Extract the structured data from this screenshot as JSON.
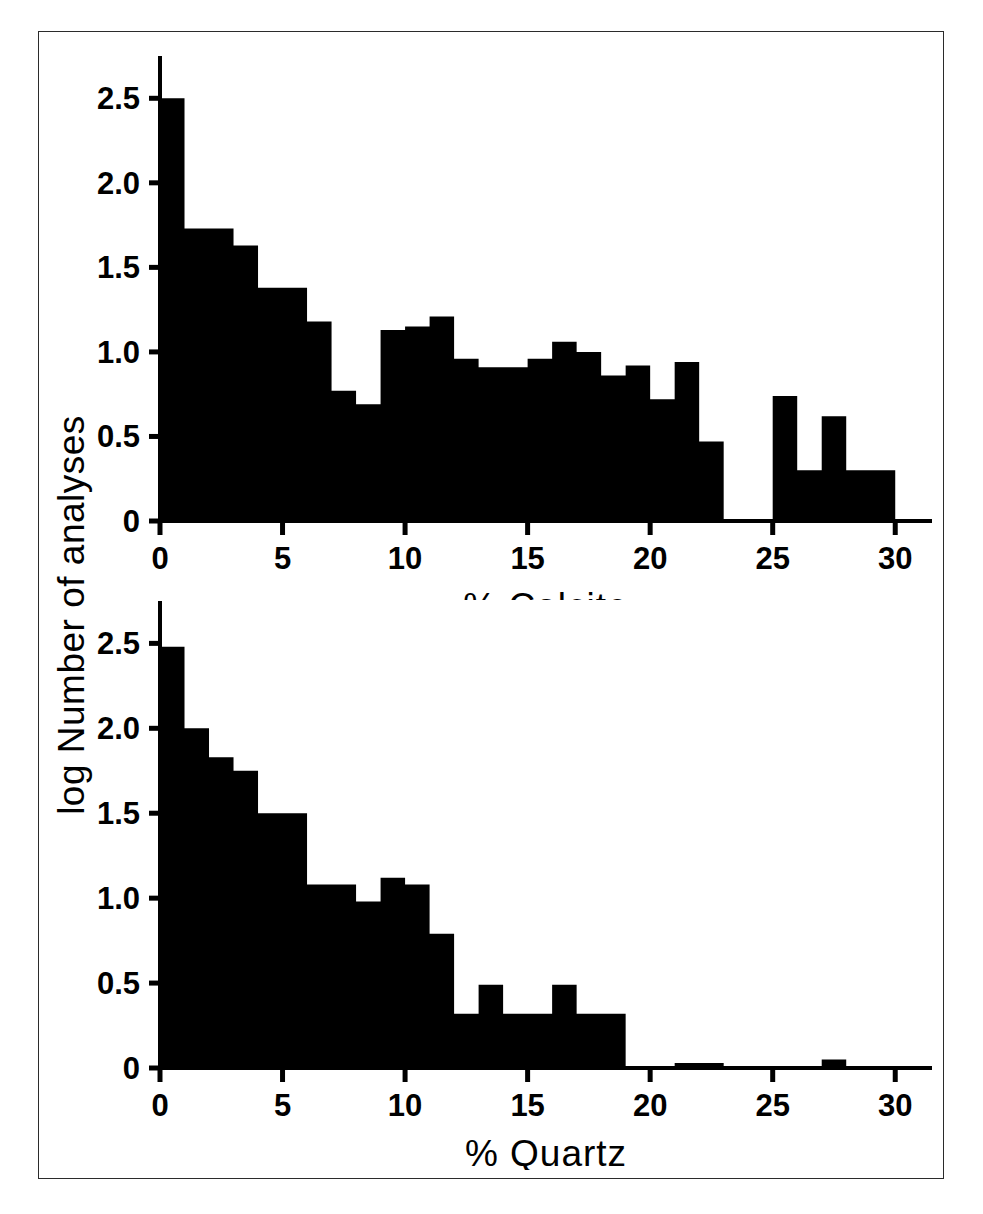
{
  "figure": {
    "y_axis_label": "log Number of analyses",
    "frame": {
      "border_color": "#2b2b2b",
      "background": "#ffffff"
    },
    "ink_color": "#000000"
  },
  "chart_data": [
    {
      "type": "bar",
      "title": "",
      "xlabel": "% Calcite",
      "ylabel": "log Number of analyses",
      "xlim": [
        0,
        31.5
      ],
      "ylim": [
        0,
        2.62
      ],
      "grid": false,
      "legend": null,
      "bin_width": 1,
      "xticks": [
        0,
        5,
        10,
        15,
        20,
        25,
        30
      ],
      "xtick_labels": [
        "0",
        "5",
        "10",
        "15",
        "20",
        "25",
        "30"
      ],
      "yticks": [
        0,
        0.5,
        1.0,
        1.5,
        2.0,
        2.5
      ],
      "ytick_labels": [
        "0",
        "0.5",
        "1.0",
        "1.5",
        "2.0",
        "2.5"
      ],
      "bin_starts": [
        0,
        1,
        2,
        3,
        4,
        5,
        6,
        7,
        8,
        9,
        10,
        11,
        12,
        13,
        14,
        15,
        16,
        17,
        18,
        19,
        20,
        21,
        22,
        23,
        24,
        25,
        26,
        27,
        28,
        29
      ],
      "values": [
        2.5,
        1.73,
        1.73,
        1.63,
        1.38,
        1.38,
        1.18,
        0.77,
        0.69,
        1.13,
        1.15,
        1.21,
        0.96,
        0.91,
        0.91,
        0.96,
        1.06,
        1.0,
        0.86,
        0.92,
        0.72,
        0.94,
        0.47,
        0.0,
        0.0,
        0.74,
        0.3,
        0.62,
        0.3,
        0.3
      ]
    },
    {
      "type": "bar",
      "title": "",
      "xlabel": "% Quartz",
      "ylabel": "log Number of analyses",
      "xlim": [
        0,
        31.5
      ],
      "ylim": [
        0,
        2.62
      ],
      "grid": false,
      "legend": null,
      "bin_width": 1,
      "xticks": [
        0,
        5,
        10,
        15,
        20,
        25,
        30
      ],
      "xtick_labels": [
        "0",
        "5",
        "10",
        "15",
        "20",
        "25",
        "30"
      ],
      "yticks": [
        0,
        0.5,
        1.0,
        1.5,
        2.0,
        2.5
      ],
      "ytick_labels": [
        "0",
        "0.5",
        "1.0",
        "1.5",
        "2.0",
        "2.5"
      ],
      "bin_starts": [
        0,
        1,
        2,
        3,
        4,
        5,
        6,
        7,
        8,
        9,
        10,
        11,
        12,
        13,
        14,
        15,
        16,
        17,
        18,
        19,
        20,
        21,
        22,
        23,
        24,
        25,
        26,
        27,
        28,
        29
      ],
      "values": [
        2.48,
        2.0,
        1.83,
        1.75,
        1.5,
        1.5,
        1.08,
        1.08,
        0.98,
        1.12,
        1.08,
        0.79,
        0.32,
        0.49,
        0.32,
        0.32,
        0.49,
        0.32,
        0.32,
        0.0,
        0.0,
        0.03,
        0.03,
        0.0,
        0.0,
        0.0,
        0.0,
        0.05,
        0.0,
        0.0
      ]
    }
  ]
}
